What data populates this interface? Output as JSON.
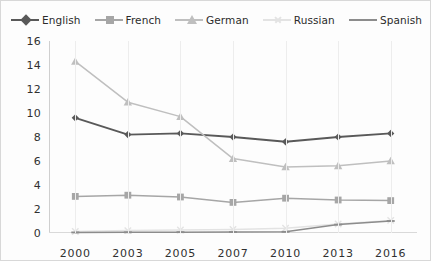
{
  "chart_data": {
    "type": "line",
    "title": "",
    "subtitle": "",
    "xlabel": "",
    "ylabel": "",
    "categories": [
      "2000",
      "2003",
      "2005",
      "2007",
      "2010",
      "2013",
      "2016"
    ],
    "x": [
      2000,
      2003,
      2005,
      2007,
      2010,
      2013,
      2016
    ],
    "ylim": [
      0,
      16
    ],
    "yticks": [
      0,
      2,
      4,
      6,
      8,
      10,
      12,
      14,
      16
    ],
    "grid": "vertical",
    "legend_position": "top",
    "series": [
      {
        "name": "English",
        "color": "#595959",
        "marker": "diamond",
        "values": [
          9.6,
          8.2,
          8.3,
          8.0,
          7.6,
          8.0,
          8.3
        ]
      },
      {
        "name": "French",
        "color": "#a6a6a6",
        "marker": "square",
        "values": [
          3.05,
          3.15,
          3.0,
          2.55,
          2.9,
          2.75,
          2.7
        ]
      },
      {
        "name": "German",
        "color": "#bfbfbf",
        "marker": "triangle",
        "values": [
          14.3,
          10.9,
          9.7,
          6.2,
          5.5,
          5.6,
          6.0
        ]
      },
      {
        "name": "Russian",
        "color": "#e3e3e3",
        "marker": "x",
        "values": [
          0.12,
          0.2,
          0.25,
          0.3,
          0.4,
          0.75,
          1.05
        ]
      },
      {
        "name": "Spanish",
        "color": "#8c8c8c",
        "marker": "dash",
        "values": [
          0.05,
          0.06,
          0.07,
          0.08,
          0.1,
          0.7,
          1.0
        ]
      }
    ]
  },
  "legend": {
    "items": [
      {
        "label": "English"
      },
      {
        "label": "French"
      },
      {
        "label": "German"
      },
      {
        "label": "Russian"
      },
      {
        "label": "Spanish"
      }
    ]
  },
  "axes": {
    "y_ticks": [
      "16",
      "14",
      "12",
      "10",
      "8",
      "6",
      "4",
      "2",
      "0"
    ],
    "x_ticks": [
      "2000",
      "2003",
      "2005",
      "2007",
      "2010",
      "2013",
      "2016"
    ]
  },
  "colors": {
    "english": "#595959",
    "french": "#a6a6a6",
    "german": "#bfbfbf",
    "russian": "#e3e3e3",
    "spanish": "#8c8c8c",
    "gridline": "#ededed",
    "axis": "#cfcfcf",
    "text": "#303030",
    "background": "#fdfdfd"
  }
}
